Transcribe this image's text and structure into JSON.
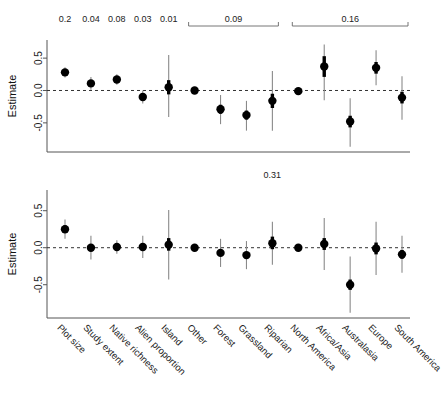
{
  "figure": {
    "panels": [
      "top",
      "bottom"
    ],
    "y_axis_label": "Estimate",
    "y_ticks": [
      "0.5",
      "0.0",
      "-0.5"
    ],
    "categories": [
      "Plot size",
      "Study extent",
      "Native richness",
      "Alien proportion",
      "Island",
      "Other",
      "Forest",
      "Grassland",
      "Riparian",
      "North America",
      "Africa/Asia",
      "Australasia",
      "Europe",
      "South America"
    ]
  },
  "chart_data": [
    {
      "type": "scatter",
      "panel": "top",
      "title": "",
      "xlabel": "",
      "ylabel": "Estimate",
      "ylim": [
        -0.95,
        0.78
      ],
      "yticks": [
        0.5,
        0.0,
        -0.5
      ],
      "ytick_labels": [
        "0.5",
        "0.0",
        "-0.5"
      ],
      "grid": false,
      "reference_line": 0.0,
      "categories": [
        "Plot size",
        "Study extent",
        "Native richness",
        "Alien proportion",
        "Island",
        "Other",
        "Forest",
        "Grassland",
        "Riparian",
        "North America",
        "Africa/Asia",
        "Australasia",
        "Europe",
        "South America"
      ],
      "estimates": [
        0.28,
        0.11,
        0.17,
        -0.1,
        0.05,
        0.0,
        -0.29,
        -0.38,
        -0.16,
        -0.01,
        0.37,
        -0.48,
        0.35,
        -0.11
      ],
      "ci_inner_low": [
        0.24,
        0.06,
        0.13,
        -0.15,
        -0.06,
        0.0,
        -0.36,
        -0.45,
        -0.27,
        -0.01,
        0.21,
        -0.57,
        0.26,
        -0.2
      ],
      "ci_inner_high": [
        0.32,
        0.16,
        0.21,
        -0.05,
        0.16,
        0.0,
        -0.22,
        -0.31,
        -0.05,
        -0.01,
        0.53,
        -0.39,
        0.44,
        -0.02
      ],
      "ci_outer_low": [
        0.2,
        0.01,
        0.09,
        -0.2,
        -0.41,
        0.0,
        -0.52,
        -0.62,
        -0.62,
        -0.01,
        -0.15,
        -0.87,
        0.08,
        -0.45
      ],
      "ci_outer_high": [
        0.36,
        0.21,
        0.25,
        0.0,
        0.55,
        0.0,
        -0.07,
        -0.16,
        0.3,
        -0.01,
        0.71,
        -0.12,
        0.62,
        0.22
      ],
      "reference_levels": [
        "Other",
        "North America"
      ],
      "annotations": [
        {
          "kind": "value",
          "text": "0.2",
          "categories": [
            "Plot size"
          ]
        },
        {
          "kind": "value",
          "text": "0.04",
          "categories": [
            "Study extent"
          ]
        },
        {
          "kind": "value",
          "text": "0.08",
          "categories": [
            "Native richness"
          ]
        },
        {
          "kind": "value",
          "text": "0.03",
          "categories": [
            "Alien proportion"
          ]
        },
        {
          "kind": "value",
          "text": "0.01",
          "categories": [
            "Island"
          ]
        },
        {
          "kind": "bracket",
          "text": "0.09",
          "categories": [
            "Other",
            "Forest",
            "Grassland",
            "Riparian"
          ]
        },
        {
          "kind": "bracket",
          "text": "0.16",
          "categories": [
            "North America",
            "Africa/Asia",
            "Australasia",
            "Europe",
            "South America"
          ]
        }
      ]
    },
    {
      "type": "scatter",
      "panel": "bottom",
      "title": "",
      "xlabel": "",
      "ylabel": "Estimate",
      "ylim": [
        -0.95,
        0.78
      ],
      "yticks": [
        0.5,
        0.0,
        -0.5
      ],
      "ytick_labels": [
        "0.5",
        "0.0",
        "-0.5"
      ],
      "grid": false,
      "reference_line": 0.0,
      "categories": [
        "Plot size",
        "Study extent",
        "Native richness",
        "Alien proportion",
        "Island",
        "Other",
        "Forest",
        "Grassland",
        "Riparian",
        "North America",
        "Africa/Asia",
        "Australasia",
        "Europe",
        "South America"
      ],
      "estimates": [
        0.25,
        0.0,
        0.01,
        0.01,
        0.04,
        0.0,
        -0.07,
        -0.1,
        0.06,
        0.0,
        0.05,
        -0.5,
        -0.01,
        -0.09
      ],
      "ci_inner_low": [
        0.2,
        0.0,
        0.0,
        0.0,
        -0.04,
        0.0,
        -0.11,
        -0.14,
        -0.02,
        0.0,
        -0.03,
        -0.57,
        -0.09,
        -0.15
      ],
      "ci_inner_high": [
        0.3,
        0.0,
        0.02,
        0.02,
        0.13,
        0.0,
        -0.03,
        -0.06,
        0.15,
        0.0,
        0.13,
        -0.43,
        0.07,
        -0.03
      ],
      "ci_outer_low": [
        0.12,
        -0.16,
        -0.08,
        -0.14,
        -0.43,
        0.0,
        -0.26,
        -0.29,
        -0.23,
        0.0,
        -0.3,
        -0.88,
        -0.37,
        -0.34
      ],
      "ci_outer_high": [
        0.38,
        0.16,
        0.1,
        0.16,
        0.51,
        0.0,
        0.12,
        0.09,
        0.35,
        0.0,
        0.4,
        -0.12,
        0.35,
        0.16
      ],
      "reference_levels": [
        "Other",
        "North America"
      ],
      "annotations": [
        {
          "kind": "value",
          "text": "0.31",
          "categories": [
            "Riparian"
          ]
        }
      ]
    }
  ]
}
